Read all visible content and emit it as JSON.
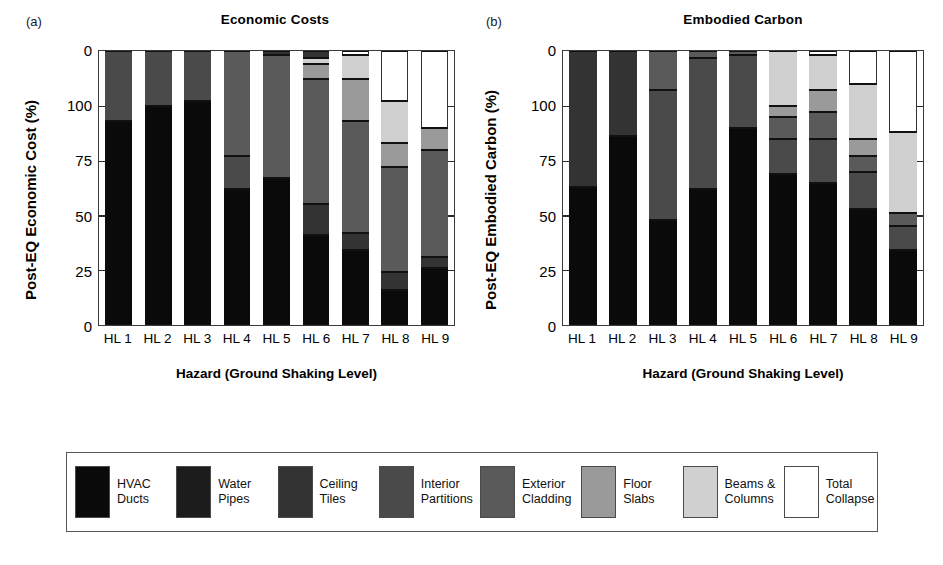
{
  "figure": {
    "background": "#ffffff",
    "panels": [
      {
        "letter": "(a)",
        "title": "Economic Costs",
        "ylabel": "Post-EQ Economic Cost (%)",
        "xlabel": "Hazard (Ground Shaking Level)"
      },
      {
        "letter": "(b)",
        "title": "Embodied Carbon",
        "ylabel": "Post-EQ Embodied Carbon (%)",
        "xlabel": "Hazard (Ground Shaking Level)"
      }
    ]
  },
  "legend": {
    "items": [
      {
        "label": "HVAC\nDucts",
        "color": "#0a0a0a"
      },
      {
        "label": "Water\nPipes",
        "color": "#1c1c1c"
      },
      {
        "label": "Ceiling\nTiles",
        "color": "#333333"
      },
      {
        "label": "Interior\nPartitions",
        "color": "#4a4a4a"
      },
      {
        "label": "Exterior\nCladding",
        "color": "#5a5a5a"
      },
      {
        "label": "Floor\nSlabs",
        "color": "#9a9a9a"
      },
      {
        "label": "Beams &\nColumns",
        "color": "#d0d0d0"
      },
      {
        "label": "Total\nCollapse",
        "color": "#ffffff"
      }
    ]
  },
  "chart_data": [
    {
      "type": "bar",
      "stacked": true,
      "inverted_yaxis": true,
      "title": "Economic Costs",
      "xlabel": "Hazard (Ground Shaking Level)",
      "ylabel": "Post-EQ Economic Cost (%)",
      "ylim": [
        0,
        125
      ],
      "ytick_values": [
        0,
        100,
        75,
        50,
        25,
        0
      ],
      "ytick_labels": [
        "0",
        "100",
        "75",
        "50",
        "25",
        "0"
      ],
      "grid": false,
      "legend_position": "bottom",
      "categories": [
        "HL 1",
        "HL 2",
        "HL 3",
        "HL 4",
        "HL 5",
        "HL 6",
        "HL 7",
        "HL 8",
        "HL 9"
      ],
      "series": [
        {
          "name": "HVAC Ducts",
          "values": [
            93.0,
            99.0,
            101.0,
            61.0,
            51.0,
            41.0,
            34.0,
            16.0,
            11.0
          ]
        },
        {
          "name": "Water Pipes",
          "values": [
            0.0,
            0.0,
            0.0,
            0.0,
            0.0,
            0.0,
            0.0,
            0.0,
            0.0
          ]
        },
        {
          "name": "Ceiling Tiles",
          "values": [
            0.0,
            0.0,
            0.0,
            0.0,
            15.0,
            14.0,
            12.0,
            8.0,
            5.0
          ]
        },
        {
          "name": "Interior Partitions",
          "values": [
            32.0,
            25.0,
            23.0,
            15.0,
            0.0,
            0.0,
            0.0,
            0.0,
            0.0
          ]
        },
        {
          "name": "Exterior Cladding",
          "values": [
            0.0,
            0.0,
            0.0,
            48.0,
            58.0,
            59.0,
            51.0,
            48.0,
            49.0
          ]
        },
        {
          "name": "Floor Slabs",
          "values": [
            0.0,
            0.0,
            0.0,
            0.0,
            0.0,
            7.0,
            19.0,
            11.0,
            10.0
          ]
        },
        {
          "name": "Beams & Columns",
          "values": [
            0.0,
            0.0,
            0.0,
            0.0,
            0.0,
            3.0,
            11.0,
            19.0,
            0.0
          ]
        },
        {
          "name": "Total Collapse",
          "values": [
            0.0,
            0.0,
            0.0,
            0.0,
            0.0,
            0.0,
            0.0,
            23.0,
            35.0
          ]
        }
      ],
      "segments": [
        [
          [
            "Interior Partitions",
            0,
            32
          ],
          [
            "HVAC Ducts",
            32,
            125
          ]
        ],
        [
          [
            "Interior Partitions",
            0,
            25
          ],
          [
            "HVAC Ducts",
            25,
            125
          ]
        ],
        [
          [
            "Interior Partitions",
            0,
            23
          ],
          [
            "HVAC Ducts",
            23,
            125
          ]
        ],
        [
          [
            "Exterior Cladding",
            0,
            48
          ],
          [
            "Interior Partitions",
            48,
            63
          ],
          [
            "HVAC Ducts",
            63,
            125
          ]
        ],
        [
          [
            "Ceiling Tiles",
            0,
            2
          ],
          [
            "Exterior Cladding",
            2,
            58
          ],
          [
            "HVAC Ducts",
            58,
            125
          ]
        ],
        [
          [
            "Ceiling Tiles",
            0,
            3
          ],
          [
            "Beams & Columns",
            3,
            6
          ],
          [
            "Floor Slabs",
            6,
            13
          ],
          [
            "Exterior Cladding",
            13,
            70
          ],
          [
            "Ceiling Tiles",
            70,
            84
          ],
          [
            "HVAC Ducts",
            84,
            125
          ]
        ],
        [
          [
            "Total Collapse",
            0,
            2
          ],
          [
            "Beams & Columns",
            2,
            13
          ],
          [
            "Floor Slabs",
            13,
            32
          ],
          [
            "Exterior Cladding",
            32,
            83
          ],
          [
            "Ceiling Tiles",
            83,
            91
          ],
          [
            "HVAC Ducts",
            91,
            125
          ]
        ],
        [
          [
            "Total Collapse",
            0,
            23
          ],
          [
            "Beams & Columns",
            23,
            42
          ],
          [
            "Floor Slabs",
            42,
            53
          ],
          [
            "Exterior Cladding",
            53,
            101
          ],
          [
            "Ceiling Tiles",
            101,
            109
          ],
          [
            "HVAC Ducts",
            109,
            125
          ]
        ],
        [
          [
            "Total Collapse",
            0,
            35
          ],
          [
            "Floor Slabs",
            35,
            45
          ],
          [
            "Exterior Cladding",
            45,
            94
          ],
          [
            "Ceiling Tiles",
            94,
            99
          ],
          [
            "HVAC Ducts",
            99,
            125
          ]
        ]
      ]
    },
    {
      "type": "bar",
      "stacked": true,
      "inverted_yaxis": true,
      "title": "Embodied Carbon",
      "xlabel": "Hazard (Ground Shaking Level)",
      "ylabel": "Post-EQ Embodied Carbon (%)",
      "ylim": [
        0,
        125
      ],
      "ytick_values": [
        0,
        100,
        75,
        50,
        25,
        0
      ],
      "ytick_labels": [
        "0",
        "100",
        "75",
        "50",
        "25",
        "0"
      ],
      "grid": false,
      "legend_position": "bottom",
      "categories": [
        "HL 1",
        "HL 2",
        "HL 3",
        "HL 4",
        "HL 5",
        "HL 6",
        "HL 7",
        "HL 8",
        "HL 9"
      ],
      "series": [
        {
          "name": "HVAC Ducts",
          "values": [
            63.0,
            86.0,
            48.0,
            62.0,
            90.0,
            69.0,
            65.0,
            53.0,
            34.0
          ]
        },
        {
          "name": "Water Pipes",
          "values": [
            0.0,
            0.0,
            0.0,
            0.0,
            0.0,
            0.0,
            0.0,
            0.0,
            0.0
          ]
        },
        {
          "name": "Ceiling Tiles",
          "values": [
            62.0,
            39.0,
            0.0,
            0.0,
            0.0,
            0.0,
            0.0,
            0.0,
            0.0
          ]
        },
        {
          "name": "Interior Partitions",
          "values": [
            0.0,
            0.0,
            59.0,
            60.0,
            33.0,
            16.0,
            20.0,
            17.0,
            11.0
          ]
        },
        {
          "name": "Exterior Cladding",
          "values": [
            0.0,
            0.0,
            18.0,
            3.0,
            2.0,
            10.0,
            12.0,
            7.0,
            6.0
          ]
        },
        {
          "name": "Floor Slabs",
          "values": [
            0.0,
            0.0,
            0.0,
            0.0,
            0.0,
            5.0,
            10.0,
            8.0,
            0.0
          ]
        },
        {
          "name": "Beams & Columns",
          "values": [
            0.0,
            0.0,
            0.0,
            0.0,
            0.0,
            25.0,
            16.0,
            25.0,
            37.0
          ]
        },
        {
          "name": "Total Collapse",
          "values": [
            0.0,
            0.0,
            0.0,
            0.0,
            0.0,
            0.0,
            2.0,
            15.0,
            37.0
          ]
        }
      ],
      "segments": [
        [
          [
            "Ceiling Tiles",
            0,
            62
          ],
          [
            "HVAC Ducts",
            62,
            125
          ]
        ],
        [
          [
            "Ceiling Tiles",
            0,
            39
          ],
          [
            "HVAC Ducts",
            39,
            125
          ]
        ],
        [
          [
            "Exterior Cladding",
            0,
            18
          ],
          [
            "Interior Partitions",
            18,
            77
          ],
          [
            "HVAC Ducts",
            77,
            125
          ]
        ],
        [
          [
            "Exterior Cladding",
            0,
            3
          ],
          [
            "Interior Partitions",
            3,
            63
          ],
          [
            "HVAC Ducts",
            63,
            125
          ]
        ],
        [
          [
            "Exterior Cladding",
            0,
            2
          ],
          [
            "Interior Partitions",
            2,
            35
          ],
          [
            "HVAC Ducts",
            35,
            125
          ]
        ],
        [
          [
            "Beams & Columns",
            0,
            25
          ],
          [
            "Floor Slabs",
            25,
            30
          ],
          [
            "Exterior Cladding",
            30,
            40
          ],
          [
            "Interior Partitions",
            40,
            56
          ],
          [
            "HVAC Ducts",
            56,
            125
          ]
        ],
        [
          [
            "Total Collapse",
            0,
            2
          ],
          [
            "Beams & Columns",
            2,
            18
          ],
          [
            "Floor Slabs",
            18,
            28
          ],
          [
            "Exterior Cladding",
            28,
            40
          ],
          [
            "Interior Partitions",
            40,
            60
          ],
          [
            "HVAC Ducts",
            60,
            125
          ]
        ],
        [
          [
            "Total Collapse",
            0,
            15
          ],
          [
            "Beams & Columns",
            15,
            40
          ],
          [
            "Floor Slabs",
            40,
            48
          ],
          [
            "Exterior Cladding",
            48,
            55
          ],
          [
            "Interior Partitions",
            55,
            72
          ],
          [
            "HVAC Ducts",
            72,
            125
          ]
        ],
        [
          [
            "Total Collapse",
            0,
            37
          ],
          [
            "Beams & Columns",
            37,
            74
          ],
          [
            "Exterior Cladding",
            74,
            80
          ],
          [
            "Interior Partitions",
            80,
            91
          ],
          [
            "HVAC Ducts",
            91,
            125
          ]
        ]
      ]
    }
  ]
}
